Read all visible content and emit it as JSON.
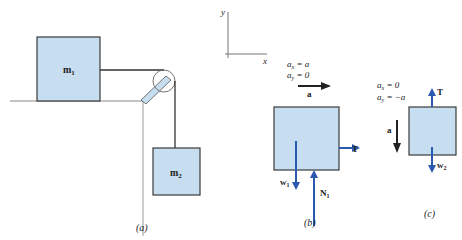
{
  "colors": {
    "block_fill": "#c6def0",
    "block_stroke": "#3a3a3a",
    "force_arrow": "#2a5ab0",
    "accel_arrow": "#222222",
    "line": "#444444",
    "wall": "#999999",
    "bracket_fill": "#c6def0"
  },
  "panel_a": {
    "label": "(a)",
    "block_m1": {
      "label_main": "m",
      "label_sub": "1"
    },
    "block_m2": {
      "label_main": "m",
      "label_sub": "2"
    }
  },
  "axes": {
    "x_label": "x",
    "y_label": "y"
  },
  "panel_b": {
    "label": "(b)",
    "eq1_lhs": "a",
    "eq1_sub": "x",
    "eq1_rhs": " = a",
    "eq2_lhs": "a",
    "eq2_sub": "y",
    "eq2_rhs": " = 0",
    "accel_label": "a",
    "tension_label": "T",
    "weight_label_main": "w",
    "weight_label_sub": "1",
    "normal_label_main": "N",
    "normal_label_sub": "1"
  },
  "panel_c": {
    "label": "(c)",
    "eq1_lhs": "a",
    "eq1_sub": "x",
    "eq1_rhs": " = 0",
    "eq2_lhs": "a",
    "eq2_sub": "y",
    "eq2_rhs": " = −a",
    "accel_label": "a",
    "tension_label": "T",
    "weight_label_main": "w",
    "weight_label_sub": "2"
  }
}
